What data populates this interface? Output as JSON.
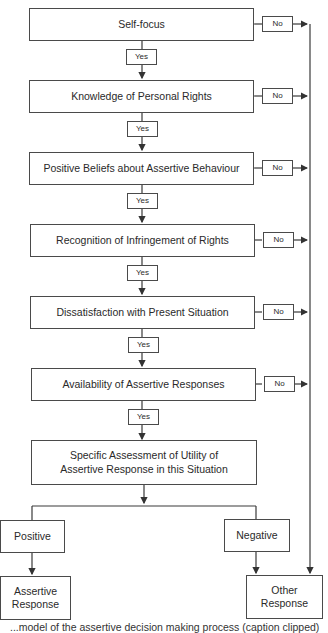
{
  "flowchart": {
    "steps": [
      {
        "label": "Self-focus"
      },
      {
        "label": "Knowledge of Personal Rights"
      },
      {
        "label": "Positive Beliefs about Assertive Behaviour"
      },
      {
        "label": "Recognition of Infringement of Rights"
      },
      {
        "label": "Dissatisfaction with Present Situation"
      },
      {
        "label": "Availability of Assertive Responses"
      }
    ],
    "yes_label": "Yes",
    "no_label": "No",
    "assessment": {
      "line1": "Specific Assessment of Utility of",
      "line2": "Assertive Response in this Situation"
    },
    "branches": {
      "positive": "Positive",
      "negative": "Negative"
    },
    "outcomes": {
      "assertive": {
        "line1": "Assertive",
        "line2": "Response"
      },
      "other": {
        "line1": "Other",
        "line2": "Response"
      }
    }
  },
  "caption": {
    "text": "...model of the assertive decision making process (caption clipped)"
  }
}
